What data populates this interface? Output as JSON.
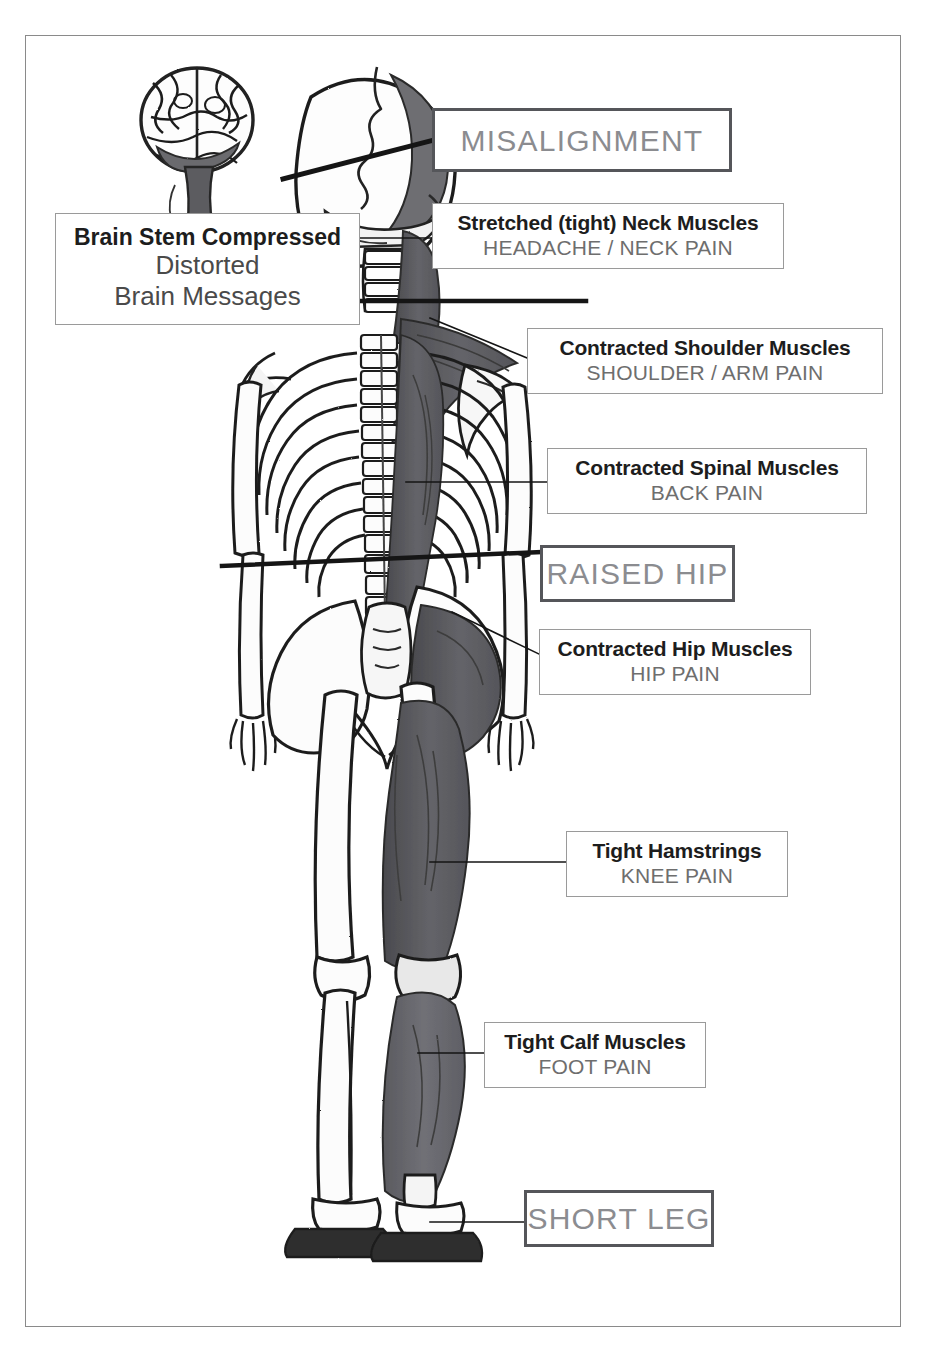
{
  "page": {
    "frame_color": "#8a8a8a",
    "background": "#ffffff"
  },
  "colors": {
    "title_text": "#1d1d1d",
    "subtitle_text": "#6e6e6e",
    "finding_text": "#8b8c90",
    "finding_border": "#55565a",
    "label_border": "#9a9a9a",
    "muscle_shade": "#5f5f63",
    "bone_outline": "#2a2a2a",
    "leader_line": "#1a1a1a"
  },
  "findings": [
    {
      "id": "misalignment",
      "label": "MISALIGNMENT"
    },
    {
      "id": "raised-hip",
      "label": "RAISED HIP"
    },
    {
      "id": "short-leg",
      "label": "SHORT LEG"
    }
  ],
  "brain_stem": {
    "line1": "Brain Stem Compressed",
    "line2": "Distorted",
    "line3": "Brain Messages"
  },
  "labels": [
    {
      "id": "neck",
      "title": "Stretched (tight) Neck Muscles",
      "symptom": "HEADACHE / NECK PAIN"
    },
    {
      "id": "shoulder",
      "title": "Contracted Shoulder Muscles",
      "symptom": "SHOULDER / ARM PAIN"
    },
    {
      "id": "spinal",
      "title": "Contracted Spinal Muscles",
      "symptom": "BACK PAIN"
    },
    {
      "id": "hip",
      "title": "Contracted Hip Muscles",
      "symptom": "HIP PAIN"
    },
    {
      "id": "hamstring",
      "title": "Tight Hamstrings",
      "symptom": "KNEE PAIN"
    },
    {
      "id": "calf",
      "title": "Tight Calf Muscles",
      "symptom": "FOOT PAIN"
    }
  ],
  "illustration": {
    "subject": "posterior view human skeleton with shaded contracted musculature on one side",
    "parts": [
      "brain",
      "skull",
      "cervical-spine",
      "thoracic-spine",
      "lumbar-spine",
      "rib-cage",
      "scapula",
      "humerus",
      "radius-ulna",
      "hand",
      "pelvis",
      "sacrum",
      "femur",
      "patella",
      "tibia-fibula",
      "foot"
    ]
  }
}
